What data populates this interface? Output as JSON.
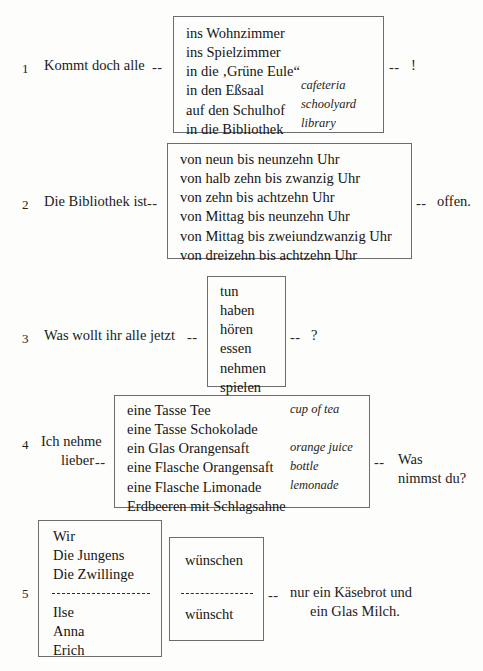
{
  "page": {
    "background_color": "#fdfdfb",
    "text_color": "#1a1a1a",
    "box_border_color": "#6d6d6d",
    "connector": "--"
  },
  "exercises": [
    {
      "number": "1",
      "stem": "Kommt doch alle",
      "tail": "!",
      "choices": [
        {
          "de": "ins Wohnzimmer",
          "gloss": ""
        },
        {
          "de": "ins Spielzimmer",
          "gloss": ""
        },
        {
          "de": "in die ‚Grüne Eule“",
          "gloss": ""
        },
        {
          "de": "in den Eßsaal",
          "gloss": "cafeteria"
        },
        {
          "de": "auf den Schulhof",
          "gloss": "schoolyard"
        },
        {
          "de": "in die Bibliothek",
          "gloss": "library"
        }
      ]
    },
    {
      "number": "2",
      "stem": "Die Bibliothek ist",
      "tail": "offen.",
      "choices": [
        {
          "de": "von neun bis neunzehn Uhr",
          "gloss": ""
        },
        {
          "de": "von halb zehn bis zwanzig Uhr",
          "gloss": ""
        },
        {
          "de": "von zehn bis achtzehn Uhr",
          "gloss": ""
        },
        {
          "de": "von Mittag bis neunzehn Uhr",
          "gloss": ""
        },
        {
          "de": "von Mittag bis zweiundzwanzig Uhr",
          "gloss": ""
        },
        {
          "de": "von dreizehn bis achtzehn Uhr",
          "gloss": ""
        }
      ]
    },
    {
      "number": "3",
      "stem": "Was wollt ihr alle jetzt",
      "tail": "?",
      "choices": [
        {
          "de": "tun",
          "gloss": ""
        },
        {
          "de": "haben",
          "gloss": ""
        },
        {
          "de": "hören",
          "gloss": ""
        },
        {
          "de": "essen",
          "gloss": ""
        },
        {
          "de": "nehmen",
          "gloss": ""
        },
        {
          "de": "spielen",
          "gloss": ""
        }
      ]
    },
    {
      "number": "4",
      "stem_line1": "Ich nehme",
      "stem_line2": "lieber",
      "tail_line1": "Was",
      "tail_line2": "nimmst du?",
      "choices": [
        {
          "de": "eine Tasse Tee",
          "gloss": "cup of tea"
        },
        {
          "de": "eine Tasse Schokolade",
          "gloss": ""
        },
        {
          "de": "ein Glas Orangensaft",
          "gloss": "orange juice"
        },
        {
          "de": "eine Flasche Orangensaft",
          "gloss": "bottle"
        },
        {
          "de": "eine Flasche Limonade",
          "gloss": "lemonade"
        },
        {
          "de": "Erdbeeren mit Schlagsahne",
          "gloss": ""
        }
      ]
    },
    {
      "number": "5",
      "tail_line1": "nur ein Käsebrot und",
      "tail_line2": "ein Glas Milch.",
      "subjects_plural": [
        "Wir",
        "Die Jungens",
        "Die Zwillinge"
      ],
      "subjects_singular": [
        "Ilse",
        "Anna",
        "Erich"
      ],
      "verb_plural": "wünschen",
      "verb_singular": "wünscht"
    }
  ]
}
